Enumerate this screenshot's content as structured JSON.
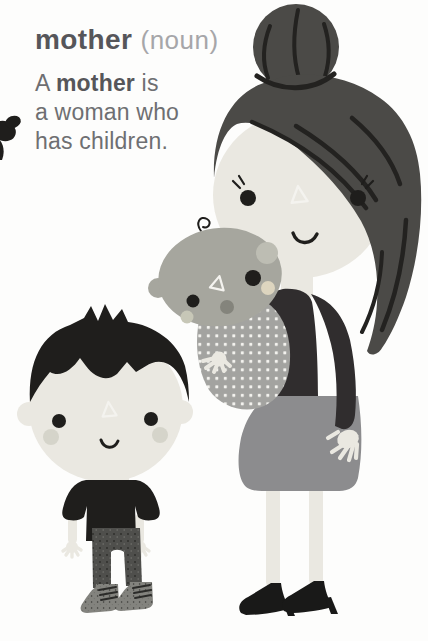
{
  "entry": {
    "word": "mother",
    "part_of_speech": "(noun)",
    "definition": {
      "line1_pre": "A ",
      "line1_bold": "mother",
      "line1_post": " is",
      "line2": "a woman who",
      "line3": "has children."
    }
  },
  "illustration": {
    "description": "Flat cartoon of a mother with a hair bun carrying a baby in a polka-dot sling; a young boy stands beside her; a small black shape bleeds off the left page edge",
    "figures": [
      "mother-figure",
      "baby-figure",
      "boy-figure"
    ],
    "decorations": [
      "white-triangle-forehead-marks",
      "polka-dot-sling",
      "page-edge-decoration"
    ]
  },
  "palette": {
    "background": "#fdfdfc",
    "heading_text": "#56565a",
    "pos_text": "#a6a6a9",
    "body_text": "#6e6f72",
    "ink_black": "#1f1e1c",
    "hair_dark": "#4b4a47",
    "hair_streak": "#232220",
    "skin_cream": "#eae8e1",
    "cheek_shade": "#d5d4ca",
    "baby_skin": "#a6a69e",
    "baby_ear_light": "#bdbdb3",
    "baby_nose": "#84847c",
    "baby_cheek_warm": "#ddd5bf",
    "baby_cheek_cool": "#c7c7b7",
    "sling_gray": "#a3a3a0",
    "sling_dot": "#f4f3ef",
    "sweater_dark": "#302d2e",
    "skirt_gray": "#8c8c8e",
    "pants_gray": "#4f4f4c",
    "pants_speck": "#2e2e2b",
    "pants_speck_light": "#73736e",
    "boot_gray": "#83837e",
    "boot_speck": "#3a3a37",
    "lace_dark": "#2b2b29",
    "shoe_black": "#191918"
  }
}
